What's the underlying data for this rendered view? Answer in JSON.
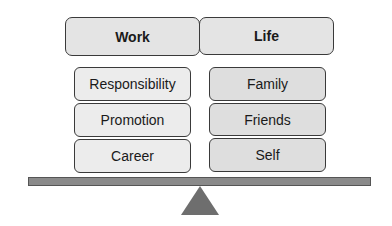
{
  "diagram": {
    "type": "balance-scale",
    "left": {
      "header": "Work",
      "items": [
        "Responsibility",
        "Promotion",
        "Career"
      ]
    },
    "right": {
      "header": "Life",
      "items": [
        "Family",
        "Friends",
        "Self"
      ]
    },
    "colors": {
      "header_fill": "#e4e4e4",
      "work_item_fill": "#ececec",
      "life_item_fill": "#dedede",
      "beam_fill": "#8a8a8a",
      "fulcrum_fill": "#6e6e6e",
      "border": "#3a3a3a"
    }
  }
}
